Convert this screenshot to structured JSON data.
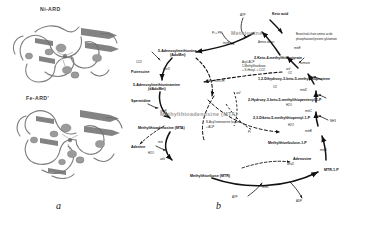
{
  "figure": {
    "panel_a_label": "a",
    "panel_b_label": "b"
  },
  "panel_a": {
    "structures": [
      {
        "name": "Ni-ARD",
        "label": "Ni-ARD"
      },
      {
        "name": "Fe-ARD'",
        "label": "Fe-ARD'"
      }
    ]
  },
  "panel_b": {
    "title_nodes": [
      {
        "id": "methionine",
        "label": "Methionine"
      },
      {
        "id": "methylthioadenosine-cycle",
        "label": "Methylthioadenosine (MTA)"
      }
    ],
    "metabolites": [
      {
        "id": "methionine",
        "label": "Methionine"
      },
      {
        "id": "adomet",
        "label": "5-Adenosylmethionine"
      },
      {
        "id": "adomet-abbr",
        "label": "(AdoMet)"
      },
      {
        "id": "dadomet",
        "label": "5-Adenosylmethioninamine"
      },
      {
        "id": "dadomet-abbr",
        "label": "(dAdoMet)"
      },
      {
        "id": "mta",
        "label": "Methylthioadenosine (MTA)"
      },
      {
        "id": "mtr",
        "label": "Methylthioribose (MTR)"
      },
      {
        "id": "mtr1p",
        "label": "MTR-1-P"
      },
      {
        "id": "mtru1p",
        "label": "Methylthioribulose-1-P"
      },
      {
        "id": "diketo",
        "label": "2,3-Diketo-5-methylthiopentyl-1-P"
      },
      {
        "id": "hydroxyketo",
        "label": "2-Hydroxy-3-keto-5-methylthiopentenyl-1-P"
      },
      {
        "id": "dihydroxy",
        "label": "1,2-Dihydroxy-3-keto-5-methylthiopentene"
      },
      {
        "id": "ketobutyrate",
        "label": "2-Keto-4-methylthiobutyrate"
      },
      {
        "id": "spermidine",
        "label": "Spermidine"
      },
      {
        "id": "putrescine",
        "label": "Putrescine"
      },
      {
        "id": "adenine",
        "label": "Adenine"
      },
      {
        "id": "adenosine",
        "label": "Adenosine"
      },
      {
        "id": "keto-acid",
        "label": "Keto acid"
      }
    ],
    "enzymes": [
      {
        "id": "metk",
        "label": "metK"
      },
      {
        "id": "speD",
        "label": "speD"
      },
      {
        "id": "speE",
        "label": "speE"
      },
      {
        "id": "mtn",
        "label": "mtn"
      },
      {
        "id": "mtnK",
        "label": "mtnK"
      },
      {
        "id": "mtnA",
        "label": "mtnA"
      },
      {
        "id": "mtnB",
        "label": "mtnB"
      },
      {
        "id": "mtnC",
        "label": "mtnC"
      },
      {
        "id": "mtnD",
        "label": "mtnD"
      },
      {
        "id": "mtnE",
        "label": "mtnE"
      },
      {
        "id": "ard",
        "label": "ard"
      },
      {
        "id": "ardp",
        "label": "ard'"
      },
      {
        "id": "deoD",
        "label": "deoD"
      },
      {
        "id": "add",
        "label": "add"
      }
    ],
    "cofactors": [
      {
        "id": "atp",
        "label": "ATP"
      },
      {
        "id": "pi-ppi",
        "label": "Pi + PPi"
      },
      {
        "id": "co2",
        "label": "CO2"
      },
      {
        "id": "o2-a",
        "label": "O2"
      },
      {
        "id": "o2-b",
        "label": "O2"
      },
      {
        "id": "h2o-a",
        "label": "H2O"
      },
      {
        "id": "h2o-b",
        "label": "H2O"
      },
      {
        "id": "h2o-c",
        "label": "H2O"
      },
      {
        "id": "atp-b",
        "label": "ATP"
      },
      {
        "id": "adp-b",
        "label": "ADP"
      },
      {
        "id": "pi",
        "label": "Pi"
      },
      {
        "id": "formate",
        "label": "formate"
      },
      {
        "id": "co-hcooh",
        "label": "CO + HCOOH"
      },
      {
        "id": "amino-donor",
        "label": "Amino donor"
      },
      {
        "id": "nh3",
        "label": "NH3"
      }
    ],
    "annotations": [
      {
        "id": "acyl-acp",
        "label": "Acyl-ACP"
      },
      {
        "id": "mtr-homo",
        "label": "1-Methylthioribose"
      },
      {
        "id": "mtr-homo2",
        "label": "+ S-Hexyl- + CO2"
      },
      {
        "id": "bcaa",
        "label": "Branched-chain amino acids"
      },
      {
        "id": "bcaa2",
        "label": "phosphatase/tyrosine glutamate"
      },
      {
        "id": "acyl-hsl",
        "label": "N-Acyl homoserine lactone"
      },
      {
        "id": "acyl-hsl2",
        "label": "+ ACP"
      }
    ]
  }
}
